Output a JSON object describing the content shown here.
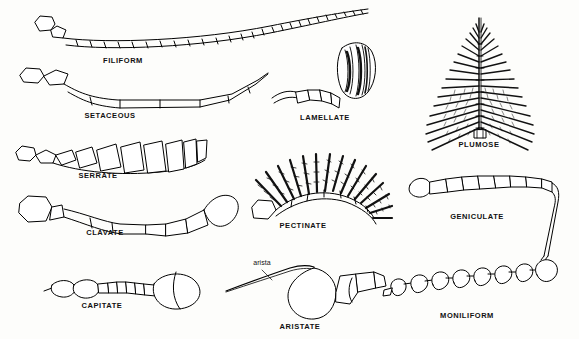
{
  "figure": {
    "background_color": "#fdfdfb",
    "ink_color": "#000000",
    "label_color": "#111111",
    "width": 579,
    "height": 339
  },
  "items": [
    {
      "id": "filiform",
      "label": "FILIFORM",
      "description": "thread-like, slender uniform segments",
      "label_x": 123,
      "label_y": 62
    },
    {
      "id": "setaceous",
      "label": "SETACEOUS",
      "description": "bristle-like, tapering to a fine point",
      "label_x": 110,
      "label_y": 117
    },
    {
      "id": "serrate",
      "label": "SERRATE",
      "description": "saw-toothed, segments with lateral points",
      "label_x": 98,
      "label_y": 177
    },
    {
      "id": "clavate",
      "label": "CLAVATE",
      "description": "club-shaped, gradually thickening toward tip",
      "label_x": 105,
      "label_y": 234
    },
    {
      "id": "capitate",
      "label": "CAPITATE",
      "description": "abruptly enlarged knob or head at the tip",
      "label_x": 102,
      "label_y": 307
    },
    {
      "id": "lamellate",
      "label": "LAMELLATE",
      "description": "terminal segments expanded into flat plates",
      "label_x": 325,
      "label_y": 119
    },
    {
      "id": "pectinate",
      "label": "PECTINATE",
      "description": "comb-like, segments with long lateral processes",
      "label_x": 303,
      "label_y": 227
    },
    {
      "id": "aristate",
      "label": "ARISTATE",
      "description": "pouch-like with a lateral bristle called the arista",
      "label_x": 300,
      "label_y": 328
    },
    {
      "id": "plumose",
      "label": "PLUMOSE",
      "description": "feather-like, whorls of fine hairs on each segment",
      "label_x": 479,
      "label_y": 146
    },
    {
      "id": "geniculate",
      "label": "GENICULATE",
      "description": "elbowed, with a long scape and bent flagellum",
      "label_x": 477,
      "label_y": 218
    },
    {
      "id": "moniliform",
      "label": "MONILIFORM",
      "description": "beadlike, rounded segments like a string of beads",
      "label_x": 467,
      "label_y": 317
    }
  ],
  "annotations": [
    {
      "id": "arista",
      "label": "arista",
      "label_x": 262,
      "label_y": 266
    }
  ]
}
